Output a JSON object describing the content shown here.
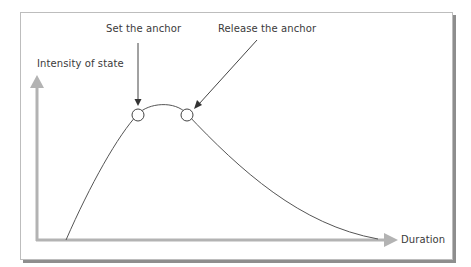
{
  "diagram": {
    "y_axis_label": "Intensity of state",
    "x_axis_label": "Duration",
    "annotations": [
      {
        "label": "Set the anchor"
      },
      {
        "label": "Release the anchor"
      }
    ],
    "colors": {
      "axis": "#b3b3b3",
      "curve": "#555555",
      "frame_border": "#bdbdbd",
      "frame_shadow": "#8e8e8e",
      "text": "#3a3a3a"
    }
  }
}
